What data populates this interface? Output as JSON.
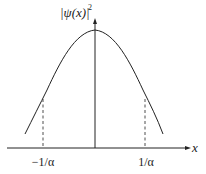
{
  "diagram": {
    "y_axis_label": "|ψ(x)|",
    "y_axis_exponent": "2",
    "x_axis_label": "x",
    "ticks": [
      {
        "label": "−1/α",
        "x": -1
      },
      {
        "label": "1/α",
        "x": 1
      }
    ],
    "curve": "Gaussian-like bell curve centered at x=0",
    "colors": {
      "line": "#222222",
      "background": "#ffffff"
    }
  }
}
